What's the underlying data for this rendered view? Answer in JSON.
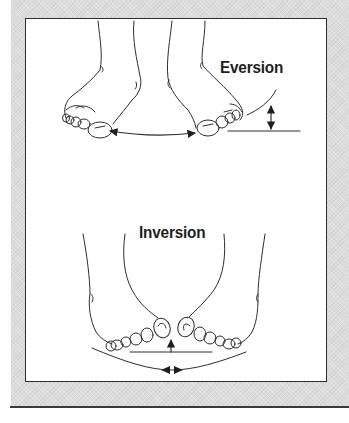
{
  "figure": {
    "panels": [
      {
        "id": "eversion",
        "label": "Eversion",
        "description": "Two feet viewed from the front with soles turned outward; double-headed arrow spans between the big toes along the ground line, and a vertical double-headed arrow shows the lift of the outer foot edge from the ground line."
      },
      {
        "id": "inversion",
        "label": "Inversion",
        "description": "Two feet viewed from the front with soles turned inward; big toes tilt toward each other above a horizontal ground line with an upward arrow, and a curved arc below with inward-pointing arrowheads."
      }
    ],
    "colors": {
      "background_mat": "#dcdcdc",
      "frame_fill": "#ffffff",
      "line": "#2e2e2e",
      "text": "#1e1e1e"
    }
  }
}
